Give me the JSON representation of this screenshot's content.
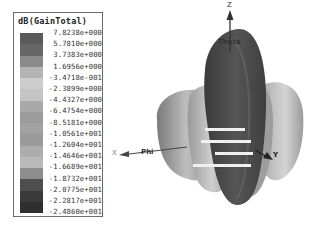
{
  "chart_data": {
    "type": "heatmap",
    "title": "dB(GainTotal)",
    "legend": {
      "title": "dB(GainTotal)",
      "position": "left",
      "levels": [
        "7.8238e+000",
        "5.7810e+000",
        "3.7383e+000",
        "1.6956e+000",
        "-3.4718e-001",
        "-2.3899e+000",
        "-4.4327e+000",
        "-6.4754e+000",
        "-8.5181e+000",
        "-1.0561e+001",
        "-1.2604e+001",
        "-1.4646e+001",
        "-1.6689e+001",
        "-1.8732e+001",
        "-2.0775e+001",
        "-2.2817e+001",
        "-2.4860e+001"
      ],
      "values": [
        7.8238,
        5.781,
        3.7383,
        1.6956,
        -0.34718,
        -2.3899,
        -4.4327,
        -6.4754,
        -8.5181,
        -10.561,
        -12.604,
        -14.646,
        -16.689,
        -18.732,
        -20.775,
        -22.817,
        -24.86
      ],
      "range": [
        -24.86,
        7.8238
      ],
      "swatch_colors": [
        "#5a5a5a",
        "#666666",
        "#8a8a8a",
        "#b4b4b4",
        "#cdcdcd",
        "#c4c4c4",
        "#a9a9a9",
        "#9c9c9c",
        "#a2a2a2",
        "#9a9a9a",
        "#adadad",
        "#b9b9b9",
        "#8e8e8e",
        "#4e4e4e",
        "#3a3a3a",
        "#2f2f2f"
      ]
    },
    "axes": {
      "z": "Z",
      "theta": "Theta",
      "x": "X",
      "phi": "Phi",
      "y": "Y"
    }
  }
}
